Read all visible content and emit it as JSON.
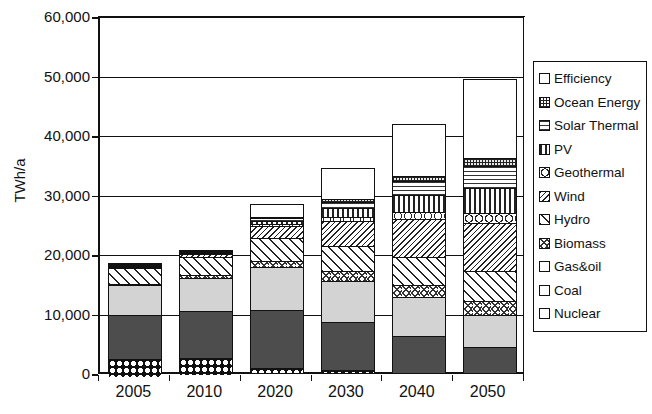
{
  "chart_data": {
    "type": "bar",
    "title": "",
    "subtitle": "",
    "stacked": true,
    "xlabel": "",
    "ylabel": "TWh/a",
    "ylim": [
      0,
      60000
    ],
    "ytick_step": 10000,
    "ytick_labels": [
      "60,000",
      "50,000",
      "40,000",
      "30,000",
      "20,000",
      "10,000",
      "0"
    ],
    "ytick_values": [
      60000,
      50000,
      40000,
      30000,
      20000,
      10000,
      0
    ],
    "grid": true,
    "grid_axis": "y",
    "legend_position": "right",
    "categories": [
      "2005",
      "2010",
      "2020",
      "2030",
      "2040",
      "2050"
    ],
    "series": [
      {
        "name": "Nuclear",
        "values": [
          2800,
          2750,
          700,
          250,
          0,
          0
        ]
      },
      {
        "name": "Coal",
        "values": [
          7500,
          7900,
          9700,
          8200,
          6000,
          4200
        ]
      },
      {
        "name": "Gas&oil",
        "values": [
          4900,
          5500,
          7200,
          6900,
          6600,
          5400
        ]
      },
      {
        "name": "Biomass",
        "values": [
          200,
          450,
          1100,
          1600,
          2000,
          2300
        ]
      },
      {
        "name": "Hydro",
        "values": [
          2800,
          3100,
          3900,
          4300,
          4700,
          5000
        ]
      },
      {
        "name": "Wind",
        "values": [
          100,
          450,
          2000,
          4100,
          6400,
          8200
        ]
      },
      {
        "name": "Geothermal",
        "values": [
          50,
          120,
          350,
          700,
          1200,
          1700
        ]
      },
      {
        "name": "PV",
        "values": [
          20,
          90,
          500,
          1500,
          2900,
          4200
        ]
      },
      {
        "name": "Solar Thermal",
        "values": [
          10,
          60,
          400,
          1100,
          2300,
          3600
        ]
      },
      {
        "name": "Ocean Energy",
        "values": [
          5,
          30,
          150,
          400,
          800,
          1300
        ]
      },
      {
        "name": "Efficiency",
        "values": [
          0,
          0,
          2200,
          5200,
          8700,
          13300
        ]
      }
    ],
    "totals": [
      18385,
      20450,
      28200,
      34250,
      41600,
      49200
    ],
    "units": "TWh/a"
  },
  "legend": {
    "items": [
      {
        "label": "Efficiency",
        "pattern": "efficiency"
      },
      {
        "label": "Ocean Energy",
        "pattern": "ocean"
      },
      {
        "label": "Solar Thermal",
        "pattern": "solarthermal"
      },
      {
        "label": "PV",
        "pattern": "pv"
      },
      {
        "label": "Geothermal",
        "pattern": "geothermal"
      },
      {
        "label": "Wind",
        "pattern": "wind"
      },
      {
        "label": "Hydro",
        "pattern": "hydro"
      },
      {
        "label": "Biomass",
        "pattern": "biomass"
      },
      {
        "label": "Gas&oil",
        "pattern": "gasoil"
      },
      {
        "label": "Coal",
        "pattern": "coal"
      },
      {
        "label": "Nuclear",
        "pattern": "nuclear"
      }
    ]
  },
  "colors": {
    "axis": "#111111",
    "grid": "#111111",
    "background": "#ffffff",
    "coal_fill": "#4d4d4d",
    "gasoil_fill": "#d3d3d3"
  }
}
